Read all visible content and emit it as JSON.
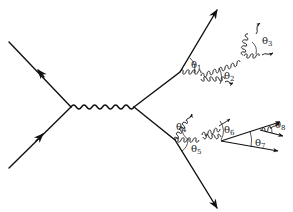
{
  "diagram": {
    "type": "feynman-parton-shower",
    "colors": {
      "line": "#111111",
      "text": "#222222",
      "background": "#ffffff"
    },
    "angle_labels": [
      {
        "id": "theta1",
        "symbol": "θ",
        "index": "1"
      },
      {
        "id": "theta2",
        "symbol": "θ",
        "index": "2"
      },
      {
        "id": "theta3",
        "symbol": "θ",
        "index": "3"
      },
      {
        "id": "theta4",
        "symbol": "θ",
        "index": "4"
      },
      {
        "id": "theta5",
        "symbol": "θ",
        "index": "5"
      },
      {
        "id": "theta6",
        "symbol": "θ",
        "index": "6"
      },
      {
        "id": "theta7",
        "symbol": "θ",
        "index": "7"
      },
      {
        "id": "theta8",
        "symbol": "θ",
        "index": "8"
      }
    ],
    "elements": {
      "incoming_fermions": 2,
      "boson_propagator": "wavy",
      "outgoing_quarks": 2,
      "gluon_lines": "curly",
      "arrows": "solid triangular"
    }
  }
}
